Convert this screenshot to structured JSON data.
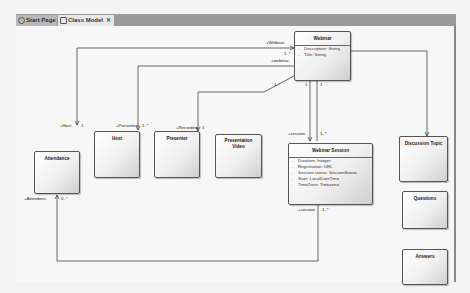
{
  "tabs": [
    {
      "label": "Start Page",
      "icon": "start-page-icon",
      "active": false
    },
    {
      "label": "Class Model",
      "icon": "class-model-icon",
      "active": true,
      "close": "✕"
    }
  ],
  "classes": {
    "webinar": {
      "name": "Webinar",
      "attributes": [
        "Description: String",
        "Title: String"
      ]
    },
    "attendance": {
      "name": "Attendance",
      "attributes": []
    },
    "host": {
      "name": "Host",
      "attributes": []
    },
    "presenter": {
      "name": "Presenter",
      "attributes": []
    },
    "presentation_video": {
      "name": "Presentation Video",
      "attributes": []
    },
    "webinar_session": {
      "name": "Webinar Session",
      "attributes": [
        "Duration: Integer",
        "Registration: URL",
        "Session status: SessionStatus",
        "Start: LocalDateTime",
        "TimeZone: Timezone"
      ]
    },
    "discussion_topic": {
      "name": "Discussion Topic",
      "attributes": []
    },
    "questions": {
      "name": "Questions",
      "attributes": []
    },
    "answers": {
      "name": "Answers",
      "attributes": []
    }
  },
  "associations": {
    "webinar_role": "+Webinar",
    "webinar_mult": "1..*",
    "webinar_role2": "+webinar",
    "host_role": "+Host",
    "host_mult": "1",
    "presenters_role": "+Presenters",
    "presenters_mult": "1..*",
    "recording_role": "+Recording",
    "recording_mult": "1",
    "webinar_mult2": "1..*",
    "one_a": "1",
    "one_b": "1",
    "session_role": "+session",
    "session_mult": "1..*",
    "attendees_role": "+Attendees",
    "attendees_mult": "0..*",
    "session_role2": "+session",
    "session_mult2": "1..*"
  }
}
